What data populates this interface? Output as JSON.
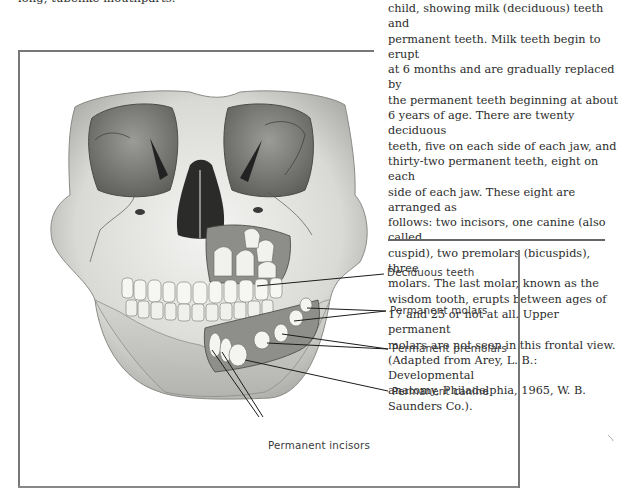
{
  "page": {
    "top_text_fragment": "long, tubelike mouthparts.",
    "caption": {
      "lines": [
        "child, showing milk (deciduous) teeth and",
        "permanent teeth. Milk teeth begin to erupt",
        "at 6 months and are gradually replaced by",
        "the permanent teeth beginning at about",
        "6 years of age. There are twenty deciduous",
        "teeth, five on each side of each jaw, and",
        "thirty-two permanent teeth, eight on each",
        "side of each jaw. These eight are arranged as",
        "follows: two incisors, one canine (also called",
        "cuspid), two premolars (bicuspids), three",
        "molars. The last molar, known as the",
        "wisdom tooth, erupts between ages of",
        "17 and 25 or not at all. Upper permanent",
        "molars are not seen in this frontal view.",
        "(Adapted from Arey, L. B.: Developmental",
        "anatomy, Philadelphia, 1965, W. B.",
        "Saunders Co.)."
      ]
    }
  },
  "figure": {
    "labels": {
      "deciduous_teeth": "Deciduous teeth",
      "permanent_molars": "Permanent molars",
      "permanent_premolars": "Permanent premolars",
      "permanent_canine": "Permanent canine",
      "permanent_incisors": "Permanent incisors"
    }
  }
}
